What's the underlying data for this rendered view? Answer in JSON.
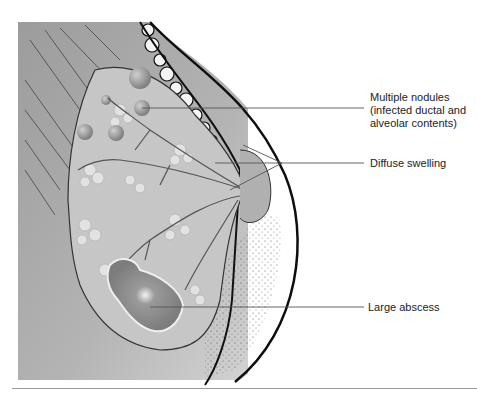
{
  "figure": {
    "type": "anatomical illustration",
    "colors": {
      "background": "#ffffff",
      "chest_wall": "#a8a8a8",
      "gland_tissue": "#c8c8c8",
      "lobules": "#dedede",
      "nodules": "#9a9a9a",
      "abscess": "#8a8a8a",
      "outline": "#111111",
      "stipple": "#333333",
      "leader_line": "#555555"
    }
  },
  "labels": [
    {
      "id": "multiple-nodules",
      "lines": [
        "Multiple nodules",
        "(infected ductal and",
        "alveolar contents)"
      ]
    },
    {
      "id": "diffuse-swelling",
      "lines": [
        "Diffuse swelling"
      ]
    },
    {
      "id": "large-abscess",
      "lines": [
        "Large abscess"
      ]
    }
  ]
}
